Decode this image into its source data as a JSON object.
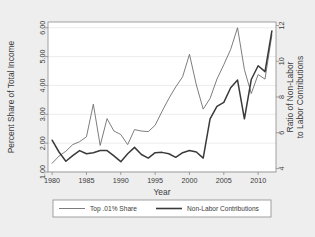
{
  "chart_data": {
    "type": "line",
    "title": "",
    "xlabel": "Year",
    "ylabel": "Percent Share of Total Income",
    "y2label": "Ratio of Non-Labor to Labor Contributions",
    "xlim": [
      1979.4,
      2012.6
    ],
    "ylim": [
      1.0,
      6.2
    ],
    "y2lim": [
      3.8,
      12.2
    ],
    "grid": true,
    "legend_position": "below-plot",
    "xticks": [
      1980,
      1985,
      1990,
      1995,
      2000,
      2005,
      2010
    ],
    "xtick_labels": [
      "1980",
      "1985",
      "1990",
      "1995",
      "2000",
      "2005",
      "2010"
    ],
    "yticks": [
      1.0,
      2.0,
      3.0,
      4.0,
      5.0,
      6.0
    ],
    "ytick_labels": [
      "1.00",
      "2.00",
      "3.00",
      "4.00",
      "5.00",
      "6.00"
    ],
    "y2ticks": [
      4,
      6,
      8,
      10,
      12
    ],
    "y2tick_labels": [
      "4",
      "6",
      "8",
      "10",
      "12"
    ],
    "x": [
      1980,
      1981,
      1982,
      1983,
      1984,
      1985,
      1986,
      1987,
      1988,
      1989,
      1990,
      1991,
      1992,
      1993,
      1994,
      1995,
      1996,
      1997,
      1998,
      1999,
      2000,
      2001,
      2002,
      2003,
      2004,
      2005,
      2006,
      2007,
      2008,
      2009,
      2010,
      2011,
      2012
    ],
    "series": [
      {
        "name": "Top .01% Share",
        "axis": "left",
        "color": "#6e6e6e",
        "width": 0.9,
        "values": [
          1.3,
          1.55,
          1.72,
          1.95,
          2.05,
          2.22,
          3.35,
          1.92,
          2.85,
          2.42,
          2.3,
          1.95,
          2.47,
          2.42,
          2.4,
          2.62,
          3.1,
          3.55,
          3.95,
          4.3,
          5.08,
          4.02,
          3.18,
          3.55,
          4.22,
          4.72,
          5.25,
          6.0,
          4.55,
          3.72,
          4.38,
          4.22,
          5.75
        ]
      },
      {
        "name": "Non-Labor Contributions",
        "axis": "right",
        "color": "#3a3a3a",
        "width": 1.5,
        "values": [
          5.58,
          4.92,
          4.4,
          4.72,
          5.0,
          4.82,
          4.88,
          5.0,
          5.0,
          4.7,
          4.38,
          4.82,
          5.18,
          4.78,
          4.58,
          4.88,
          4.9,
          4.82,
          4.62,
          4.88,
          5.0,
          4.92,
          4.58,
          6.78,
          7.48,
          7.7,
          8.52,
          8.95,
          6.78,
          8.98,
          9.75,
          9.42,
          11.7
        ]
      }
    ]
  },
  "legend": {
    "entries": [
      {
        "label": "Top .01% Share",
        "style": "thin"
      },
      {
        "label": "Non-Labor Contributions",
        "style": "thick"
      }
    ]
  },
  "colors": {
    "figure_background": "#eeeeee",
    "plot_background": "#ffffff",
    "axis": "#8a8a8a",
    "grid": "#e4e4e4",
    "text": "#3a3a3a",
    "series_thin": "#6e6e6e",
    "series_thick": "#3a3a3a"
  }
}
